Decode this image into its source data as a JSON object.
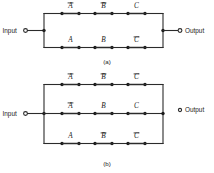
{
  "figure": {
    "line_color": "#2b2b2b",
    "node_color": "#1a1a1a",
    "background": "#ffffff"
  },
  "panels": [
    {
      "id": "a",
      "caption": "(a)",
      "input_label": "Input",
      "output_label": "Output",
      "branch_count": 2,
      "branches": [
        {
          "row": 1,
          "contacts": [
            {
              "symbol": "A",
              "negated": true,
              "text": "A̅"
            },
            {
              "symbol": "B",
              "negated": true,
              "text": "B̅"
            },
            {
              "symbol": "C",
              "negated": false,
              "text": "C"
            }
          ]
        },
        {
          "row": 2,
          "contacts": [
            {
              "symbol": "A",
              "negated": false,
              "text": "A"
            },
            {
              "symbol": "B",
              "negated": false,
              "text": "B"
            },
            {
              "symbol": "C",
              "negated": true,
              "text": "C̅"
            }
          ]
        }
      ]
    },
    {
      "id": "b",
      "caption": "(b)",
      "input_label": "Input",
      "output_label": "Output",
      "branch_count": 3,
      "branches": [
        {
          "row": 1,
          "contacts": [
            {
              "symbol": "A",
              "negated": true,
              "text": "A̅"
            },
            {
              "symbol": "B",
              "negated": true,
              "text": "B̅"
            },
            {
              "symbol": "C",
              "negated": true,
              "text": "C̅"
            }
          ]
        },
        {
          "row": 2,
          "contacts": [
            {
              "symbol": "A",
              "negated": true,
              "text": "A̅"
            },
            {
              "symbol": "B",
              "negated": false,
              "text": "B"
            },
            {
              "symbol": "C",
              "negated": false,
              "text": "C"
            }
          ]
        },
        {
          "row": 3,
          "contacts": [
            {
              "symbol": "A",
              "negated": false,
              "text": "A"
            },
            {
              "symbol": "B",
              "negated": true,
              "text": "B̅"
            },
            {
              "symbol": "C",
              "negated": true,
              "text": "C̅"
            }
          ]
        }
      ]
    }
  ]
}
